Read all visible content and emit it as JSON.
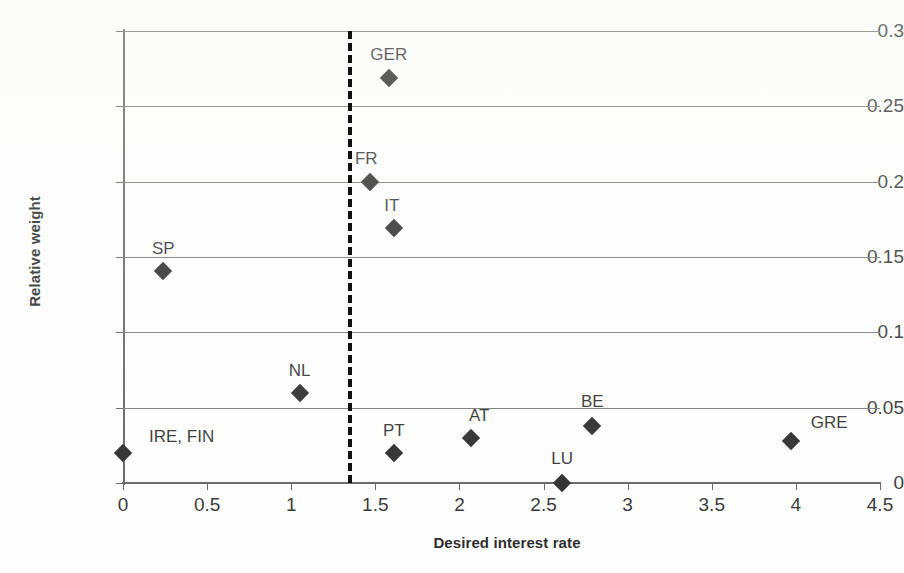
{
  "chart_data": {
    "type": "scatter",
    "title": "",
    "xlabel": "Desired interest rate",
    "ylabel": "Relative weight",
    "xlim": [
      0,
      4.5
    ],
    "ylim": [
      0,
      0.3
    ],
    "grid": "horizontal",
    "legend": "none",
    "x_ticks": [
      "0",
      "0.5",
      "1",
      "1.5",
      "2",
      "2.5",
      "3",
      "3.5",
      "4",
      "4.5"
    ],
    "x_tick_values": [
      0,
      0.5,
      1,
      1.5,
      2,
      2.5,
      3,
      3.5,
      4,
      4.5
    ],
    "y_ticks": [
      "0",
      "0.05",
      "0.1",
      "0.15",
      "0.2",
      "0.25",
      "0.3"
    ],
    "y_tick_values": [
      0,
      0.05,
      0.1,
      0.15,
      0.2,
      0.25,
      0.3
    ],
    "marker": "diamond",
    "marker_color": "#141414",
    "points": [
      {
        "label": "IRE, FIN",
        "x": 0.0,
        "y": 0.02,
        "label_dx": 26,
        "label_dy": -26,
        "anchor": "left"
      },
      {
        "label": "SP",
        "x": 0.24,
        "y": 0.141,
        "label_dx": 0,
        "label_dy": -32,
        "anchor": "center"
      },
      {
        "label": "NL",
        "x": 1.05,
        "y": 0.06,
        "label_dx": 0,
        "label_dy": -32,
        "anchor": "center"
      },
      {
        "label": "GER",
        "x": 1.58,
        "y": 0.269,
        "label_dx": 0,
        "label_dy": -33,
        "anchor": "center"
      },
      {
        "label": "FR",
        "x": 1.47,
        "y": 0.2,
        "label_dx": -4,
        "label_dy": -33,
        "anchor": "center"
      },
      {
        "label": "IT",
        "x": 1.61,
        "y": 0.169,
        "label_dx": -2,
        "label_dy": -32,
        "anchor": "center"
      },
      {
        "label": "PT",
        "x": 1.61,
        "y": 0.02,
        "label_dx": 0,
        "label_dy": -32,
        "anchor": "center"
      },
      {
        "label": "AT",
        "x": 2.07,
        "y": 0.03,
        "label_dx": 8,
        "label_dy": -32,
        "anchor": "center"
      },
      {
        "label": "LU",
        "x": 2.61,
        "y": 0.0,
        "label_dx": 0,
        "label_dy": -34,
        "anchor": "center"
      },
      {
        "label": "BE",
        "x": 2.79,
        "y": 0.038,
        "label_dx": 0,
        "label_dy": -34,
        "anchor": "center"
      },
      {
        "label": "GRE",
        "x": 3.97,
        "y": 0.028,
        "label_dx": 20,
        "label_dy": -28,
        "anchor": "left"
      }
    ],
    "annotations": [
      {
        "name": "threshold-line",
        "type": "vertical-dashed-line",
        "x": 1.34,
        "color": "#111111"
      }
    ]
  },
  "axis_colors": {
    "axis": "#555555",
    "grid": "#6d6d6d",
    "text": "#1b1b1b"
  }
}
